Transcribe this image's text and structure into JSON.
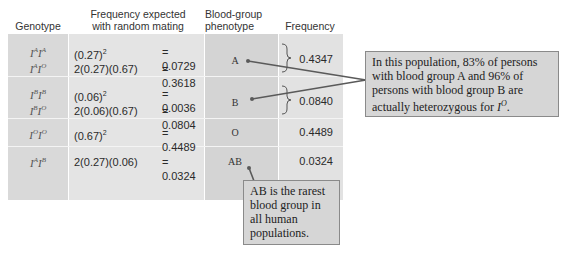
{
  "table": {
    "headers": {
      "genotype": "Genotype",
      "expected_line1": "Frequency expected",
      "expected_line2": "with random mating",
      "phenotype_line1": "Blood-group",
      "phenotype_line2": "phenotype",
      "frequency": "Frequency"
    },
    "rows": [
      {
        "genotypes": [
          {
            "base1": "I",
            "sup1": "A",
            "base2": "I",
            "sup2": "A"
          },
          {
            "base1": "I",
            "sup1": "A",
            "base2": "I",
            "sup2": "O"
          }
        ],
        "calcs": [
          {
            "expr": "(0.27)",
            "exp": "2",
            "rest": "",
            "value": "= 0.0729"
          },
          {
            "expr": "2(0.27)(0.67)",
            "exp": "",
            "rest": "",
            "value": "= 0.3618"
          }
        ],
        "phenotype": "A",
        "frequency": "0.4347"
      },
      {
        "genotypes": [
          {
            "base1": "I",
            "sup1": "B",
            "base2": "I",
            "sup2": "B"
          },
          {
            "base1": "I",
            "sup1": "B",
            "base2": "I",
            "sup2": "O"
          }
        ],
        "calcs": [
          {
            "expr": "(0.06)",
            "exp": "2",
            "rest": "",
            "value": "= 0.0036"
          },
          {
            "expr": "2(0.06)(0.67)",
            "exp": "",
            "rest": "",
            "value": "= 0.0804"
          }
        ],
        "phenotype": "B",
        "frequency": "0.0840"
      },
      {
        "genotypes": [
          {
            "base1": "I",
            "sup1": "O",
            "base2": "I",
            "sup2": "O"
          }
        ],
        "calcs": [
          {
            "expr": "(0.67)",
            "exp": "2",
            "rest": "",
            "value": "= 0.4489"
          }
        ],
        "phenotype": "O",
        "frequency": "0.4489"
      },
      {
        "genotypes": [
          {
            "base1": "I",
            "sup1": "A",
            "base2": "I",
            "sup2": "B"
          }
        ],
        "calcs": [
          {
            "expr": "2(0.27)(0.06)",
            "exp": "",
            "rest": "",
            "value": "= 0.0324"
          }
        ],
        "phenotype": "AB",
        "frequency": "0.0324"
      }
    ]
  },
  "callouts": {
    "heterozygous": {
      "text_before": "In this population, 83% of persons with blood group A and 96% of persons with blood group B are actually heterozygous for ",
      "italic_base": "I",
      "italic_sup": "O",
      "text_after": "."
    },
    "rarest": {
      "text": "AB is the rarest blood group in all human populations."
    }
  },
  "colors": {
    "cell_gray": "#d9d9d9",
    "callout_bg": "#d6d6d6",
    "callout_border": "#8a8a8a",
    "leader_line": "#5a5a5a"
  }
}
